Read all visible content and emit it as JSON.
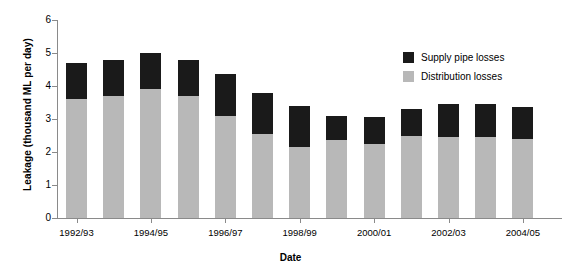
{
  "chart_data": {
    "type": "bar",
    "stacked": true,
    "title": "",
    "xlabel": "Date",
    "ylabel": "Leakage (thousand ML per day)",
    "ylim": [
      0,
      6
    ],
    "yticks": [
      0,
      1,
      2,
      3,
      4,
      5,
      6
    ],
    "grid": false,
    "legend_position": "top-right",
    "categories": [
      "1992/93",
      "1993/94",
      "1994/95",
      "1995/96",
      "1996/97",
      "1997/98",
      "1998/99",
      "1999/00",
      "2000/01",
      "2001/02",
      "2002/03",
      "2003/04",
      "2004/05"
    ],
    "xtick_labels": [
      "1992/93",
      "1994/95",
      "1996/97",
      "1998/99",
      "2000/01",
      "2002/03",
      "2004/05"
    ],
    "xtick_category_index": [
      0,
      2,
      4,
      6,
      8,
      10,
      12
    ],
    "series": [
      {
        "name": "Distribution losses",
        "color": "#b8b8b8",
        "values": [
          3.6,
          3.7,
          3.9,
          3.7,
          3.1,
          2.55,
          2.15,
          2.35,
          2.25,
          2.5,
          2.45,
          2.45,
          2.4
        ]
      },
      {
        "name": "Supply pipe losses",
        "color": "#1a1a1a",
        "values": [
          1.1,
          1.1,
          1.1,
          1.1,
          1.25,
          1.25,
          1.25,
          0.75,
          0.8,
          0.8,
          1.0,
          1.0,
          0.95
        ]
      }
    ],
    "totals": [
      4.7,
      4.8,
      5.0,
      4.8,
      4.35,
      3.8,
      3.4,
      3.1,
      3.05,
      3.3,
      3.45,
      3.45,
      3.35
    ]
  },
  "legend": {
    "items": [
      {
        "label": "Supply pipe losses",
        "color": "#1a1a1a"
      },
      {
        "label": "Distribution losses",
        "color": "#b8b8b8"
      }
    ]
  },
  "axes": {
    "y_title": "Leakage (thousand ML per day)",
    "x_title": "Date"
  }
}
